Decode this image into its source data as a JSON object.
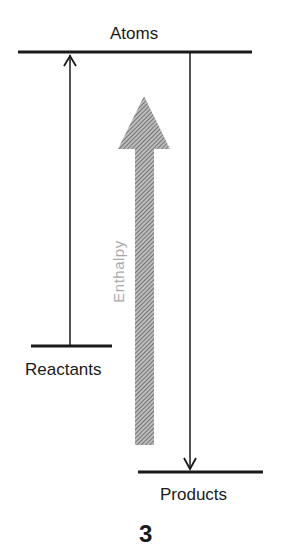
{
  "diagram": {
    "levels": {
      "top": "Atoms",
      "left": "Reactants",
      "bottom": "Products"
    },
    "axis_label": "Enthalpy",
    "figure_number": "3",
    "colors": {
      "line": "#1a1a1a",
      "hatch": "#888888"
    }
  }
}
